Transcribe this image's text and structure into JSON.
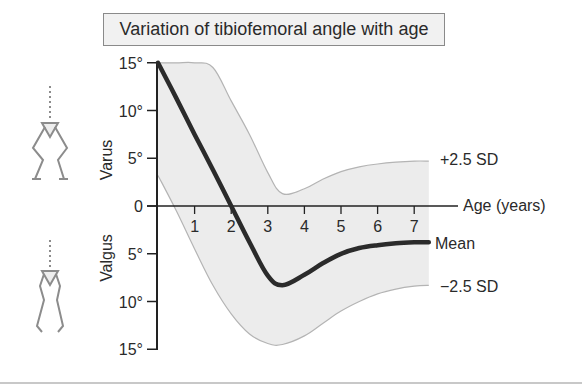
{
  "title": "Variation of tibiofemoral angle with age",
  "labels": {
    "varus": "Varus",
    "valgus": "Valgus",
    "x_axis": "Age (years)",
    "upper_sd": "+2.5 SD",
    "mean": "Mean",
    "lower_sd": "−2.5 SD"
  },
  "y_ticks": [
    {
      "label": "15°",
      "value": 15
    },
    {
      "label": "10°",
      "value": 10
    },
    {
      "label": "5°",
      "value": 5
    },
    {
      "label": "0",
      "value": 0
    },
    {
      "label": "5°",
      "value": -5
    },
    {
      "label": "10°",
      "value": -10
    },
    {
      "label": "15°",
      "value": -15
    }
  ],
  "x_ticks": [
    "1",
    "2",
    "3",
    "4",
    "5",
    "6",
    "7"
  ],
  "icons": {
    "upper": "varus-legs-icon",
    "lower": "valgus-legs-icon"
  },
  "colors": {
    "band_fill": "#ececec",
    "band_edge": "#b4b4b4",
    "mean_line": "#2b2b2b",
    "axis": "#222222",
    "icon": "#8c8c8c",
    "title_bg": "#f1f1f1"
  },
  "chart_data": {
    "type": "line",
    "title": "Variation of tibiofemoral angle with age",
    "xlabel": "Age (years)",
    "ylabel": "Tibiofemoral angle (degrees; positive = Varus, negative = Valgus)",
    "xlim": [
      0,
      7.4
    ],
    "ylim": [
      -15,
      15
    ],
    "x_ticks": [
      1,
      2,
      3,
      4,
      5,
      6,
      7
    ],
    "y_ticks": [
      15,
      10,
      5,
      0,
      -5,
      -10,
      -15
    ],
    "grid": false,
    "legend": "inline labels at right end of curves",
    "x": [
      0,
      0.5,
      1,
      1.5,
      2,
      2.5,
      3,
      3.4,
      4,
      4.5,
      5,
      5.5,
      6,
      6.5,
      7,
      7.4
    ],
    "series": [
      {
        "name": "+2.5 SD",
        "values": [
          15,
          15,
          15,
          14.5,
          11,
          7.5,
          3.5,
          1.3,
          1.8,
          2.8,
          3.6,
          4.1,
          4.4,
          4.6,
          4.7,
          4.7
        ]
      },
      {
        "name": "Mean",
        "values": [
          15,
          11.3,
          7.5,
          3.8,
          0,
          -3.8,
          -7.3,
          -8.3,
          -7.2,
          -6.0,
          -5.0,
          -4.4,
          -4.1,
          -3.9,
          -3.8,
          -3.8
        ]
      },
      {
        "name": "−2.5 SD",
        "values": [
          3.2,
          -0.5,
          -4.5,
          -8.3,
          -11.3,
          -13.4,
          -14.4,
          -14.5,
          -13.6,
          -12.3,
          -11.0,
          -10.0,
          -9.2,
          -8.7,
          -8.4,
          -8.3
        ]
      }
    ],
    "annotations": [
      "Varus",
      "Valgus",
      "+2.5 SD",
      "Mean",
      "−2.5 SD"
    ]
  }
}
